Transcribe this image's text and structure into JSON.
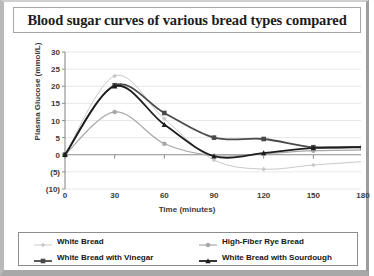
{
  "title": "Blood sugar curves of various bread types compared",
  "chart_data": {
    "type": "line",
    "title": "Blood sugar curves of various bread types compared",
    "xlabel": "Time (minutes)",
    "ylabel": "Plasma Glucose (mmol/L)",
    "x": [
      0,
      30,
      60,
      90,
      120,
      150,
      180
    ],
    "xticklabels": [
      "0",
      "30",
      "60",
      "90",
      "120",
      "150",
      "180"
    ],
    "xlim": [
      0,
      180
    ],
    "ylim": [
      -10,
      30
    ],
    "yticks": [
      30,
      25,
      20,
      15,
      10,
      5,
      0,
      -5,
      -10
    ],
    "yticklabels": [
      "30",
      "25",
      "20",
      "15",
      "10",
      "5",
      "0",
      "(5)",
      "(10)"
    ],
    "grid": true,
    "legend_position": "bottom",
    "series": [
      {
        "name": "White Bread",
        "color": "#c9c9c9",
        "marker": "diamond",
        "width": 1,
        "values": [
          0,
          23,
          10.5,
          -1.5,
          -4.2,
          -3.0,
          -2.0
        ]
      },
      {
        "name": "High-Fiber Rye Bread",
        "color": "#a8a8a8",
        "marker": "circle",
        "width": 1.2,
        "values": [
          0,
          12.5,
          3.2,
          -0.3,
          0.3,
          1.2,
          1.4
        ]
      },
      {
        "name": "White Bread with Vinegar",
        "color": "#4a4a4a",
        "marker": "square",
        "width": 1.8,
        "values": [
          0,
          20.3,
          12.2,
          5.0,
          4.6,
          2.2,
          2.3
        ]
      },
      {
        "name": "White Bread with Sourdough",
        "color": "#1e1e1e",
        "marker": "triangle",
        "width": 1.8,
        "values": [
          0,
          20.0,
          8.8,
          -0.4,
          0.5,
          2.0,
          2.2
        ]
      }
    ]
  },
  "legend": [
    {
      "label": "White Bread"
    },
    {
      "label": "High-Fiber Rye Bread"
    },
    {
      "label": "White Bread with Vinegar"
    },
    {
      "label": "White Bread with Sourdough"
    }
  ]
}
